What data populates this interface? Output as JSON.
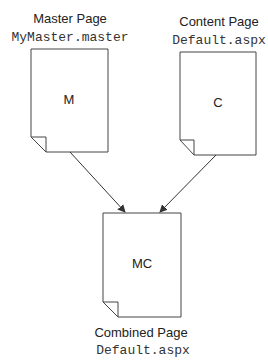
{
  "diagram": {
    "master": {
      "title": "Master Page",
      "file": "MyMaster.master",
      "label": "M"
    },
    "content": {
      "title": "Content Page",
      "file": "Default.aspx",
      "label": "C"
    },
    "combined": {
      "title": "Combined Page",
      "file": "Default.aspx",
      "label": "MC"
    },
    "edges": [
      {
        "from": "master",
        "to": "combined"
      },
      {
        "from": "content",
        "to": "combined"
      }
    ]
  }
}
